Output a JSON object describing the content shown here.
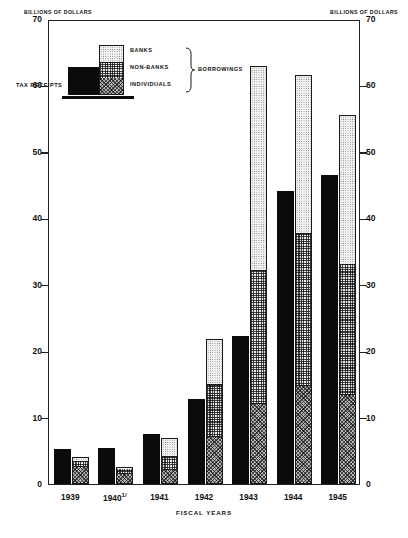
{
  "axis_caption_left": "BILLIONS OF DOLLARS",
  "axis_caption_right": "BILLIONS OF DOLLARS",
  "xtitle": "FISCAL YEARS",
  "legend": {
    "tax_label": "TAX RECEIPTS",
    "banks_label": "BANKS",
    "nonbanks_label": "NON-BANKS",
    "individuals_label": "INDIVIDUALS",
    "group_label": "BORROWINGS"
  },
  "chart_data": {
    "type": "bar",
    "title": "",
    "xlabel": "FISCAL YEARS",
    "ylabel": "BILLIONS OF DOLLARS",
    "ylim": [
      0,
      70
    ],
    "yticks": [
      0,
      10,
      20,
      30,
      40,
      50,
      60,
      70
    ],
    "ytick_labels": [
      "0",
      "10",
      "20",
      "30",
      "40",
      "50",
      "60",
      "70"
    ],
    "grid": false,
    "legend_position": "upper-left-inset",
    "dual_axis": true,
    "categories": [
      "1939",
      "1940",
      "1941",
      "1942",
      "1943",
      "1944",
      "1945"
    ],
    "category_labels": [
      "1939",
      "1940 1/",
      "1941",
      "1942",
      "1943",
      "1944",
      "1945"
    ],
    "footnote_marker": "1/",
    "series": [
      {
        "name": "TAX RECEIPTS",
        "stack": "receipts",
        "fill": "solid-black",
        "values": [
          5.2,
          5.4,
          7.6,
          12.8,
          22.3,
          44.1,
          46.5
        ]
      },
      {
        "name": "INDIVIDUALS",
        "stack": "borrowings",
        "fill": "dark-check",
        "values": [
          2.6,
          1.6,
          2.0,
          7.0,
          12.0,
          14.7,
          13.3
        ]
      },
      {
        "name": "NON-BANKS",
        "stack": "borrowings",
        "fill": "light-check",
        "values": [
          0.8,
          0.9,
          2.1,
          7.9,
          20.0,
          22.9,
          19.7
        ]
      },
      {
        "name": "BANKS",
        "stack": "borrowings",
        "fill": "dotted",
        "values": [
          0.6,
          0.1,
          2.9,
          7.0,
          31.0,
          24.0,
          22.6
        ]
      }
    ],
    "borrowings_totals": [
      4.0,
      2.6,
      7.0,
      21.9,
      63.0,
      61.6,
      55.6
    ]
  }
}
